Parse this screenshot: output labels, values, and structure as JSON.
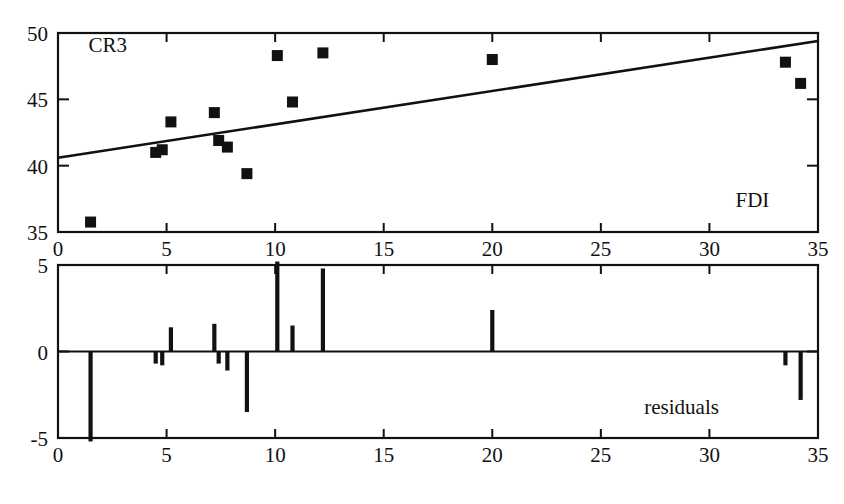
{
  "figure": {
    "width": 844,
    "height": 504,
    "background": "#ffffff",
    "ink_color": "#111111"
  },
  "labels": {
    "top_panel_series_label": "CR3",
    "top_panel_x_label": "FDI",
    "bottom_panel_label": "residuals"
  },
  "chart_data": [
    {
      "type": "scatter",
      "title": "",
      "subtitle": "",
      "xlabel": "FDI",
      "ylabel": "CR3",
      "grid": false,
      "legend": "none",
      "xlim": [
        0,
        35
      ],
      "ylim": [
        35,
        50
      ],
      "xticks": [
        0,
        5,
        10,
        15,
        20,
        25,
        30,
        35
      ],
      "xticklabels": [
        "0",
        "5",
        "10",
        "15",
        "20",
        "25",
        "30",
        "35"
      ],
      "yticks": [
        35,
        40,
        45,
        50
      ],
      "yticklabels": [
        "35",
        "40",
        "45",
        "50"
      ],
      "annotations": [
        {
          "text": "CR3",
          "x": 1.4,
          "y": 48.6
        },
        {
          "text": "FDI",
          "x": 31.2,
          "y": 36.9
        }
      ],
      "series": [
        {
          "name": "observations",
          "marker": "filled-square",
          "x": [
            1.5,
            4.5,
            4.8,
            5.2,
            7.2,
            7.4,
            7.8,
            8.7,
            10.1,
            10.8,
            12.2,
            20.0,
            33.5,
            34.2
          ],
          "y": [
            35.75,
            41.0,
            41.2,
            43.3,
            44.0,
            41.9,
            41.4,
            39.4,
            48.3,
            44.8,
            48.5,
            48.0,
            47.8,
            46.2
          ]
        },
        {
          "name": "regression-line",
          "marker": "none",
          "line": true,
          "x": [
            0,
            35
          ],
          "y": [
            40.6,
            49.4
          ]
        }
      ]
    },
    {
      "type": "bar",
      "title": "",
      "subtitle": "",
      "xlabel": "",
      "ylabel": "residuals",
      "grid": false,
      "legend": "none",
      "orientation": "vertical-stems",
      "xlim": [
        0,
        35
      ],
      "ylim": [
        -5,
        5
      ],
      "xticks": [
        0,
        5,
        10,
        15,
        20,
        25,
        30,
        35
      ],
      "xticklabels": [
        "0",
        "5",
        "10",
        "15",
        "20",
        "25",
        "30",
        "35"
      ],
      "yticks": [
        -5,
        0,
        5
      ],
      "yticklabels": [
        "-5",
        "0",
        "5"
      ],
      "annotations": [
        {
          "text": "residuals",
          "x": 27.0,
          "y": -3.6
        }
      ],
      "x": [
        1.5,
        4.5,
        4.8,
        5.2,
        7.2,
        7.4,
        7.8,
        8.7,
        10.1,
        10.8,
        12.2,
        20.0,
        33.5,
        34.2
      ],
      "values": [
        -5.2,
        -0.7,
        -0.8,
        1.4,
        1.6,
        -0.7,
        -1.1,
        -3.5,
        5.2,
        1.5,
        4.8,
        2.4,
        -0.8,
        -2.8
      ]
    }
  ]
}
